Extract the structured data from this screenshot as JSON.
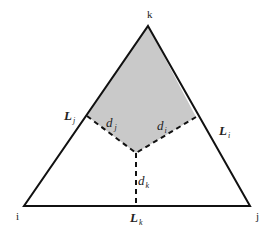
{
  "diagram": {
    "type": "triangle-region-diagram",
    "vertices": {
      "k": {
        "label": "k",
        "x": 148,
        "y": 26
      },
      "i": {
        "label": "i",
        "x": 24,
        "y": 206
      },
      "j": {
        "label": "j",
        "x": 250,
        "y": 206
      }
    },
    "center": {
      "x": 136,
      "y": 153
    },
    "edge_labels": {
      "Lj": {
        "main": "L",
        "sub": "j"
      },
      "Li": {
        "main": "L",
        "sub": "i"
      },
      "Lk": {
        "main": "L",
        "sub": "k"
      }
    },
    "distance_labels": {
      "dj": {
        "main": "d",
        "sub": "j"
      },
      "di": {
        "main": "d",
        "sub": "i"
      },
      "dk": {
        "main": "d",
        "sub": "k"
      }
    },
    "colors": {
      "shade": "#c9c9c9",
      "line": "#111111"
    }
  }
}
